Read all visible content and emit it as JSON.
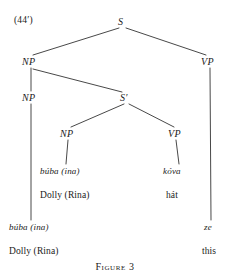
{
  "figure": {
    "example_number": "(44′)",
    "caption": "Figure 3",
    "width": 230,
    "height": 278,
    "line_color": "#333333",
    "text_color": "#1a1a1a",
    "background": "#ffffff"
  },
  "tree": {
    "type": "syntax-tree",
    "nodes": [
      {
        "id": "s-root",
        "label": "S",
        "x": 122,
        "y": 22,
        "kind": "nonterminal"
      },
      {
        "id": "np-outer",
        "label": "NP",
        "x": 29,
        "y": 62,
        "kind": "nonterminal"
      },
      {
        "id": "vp-outer",
        "label": "VP",
        "x": 208,
        "y": 62,
        "kind": "nonterminal"
      },
      {
        "id": "np-inner",
        "label": "NP",
        "x": 29,
        "y": 98,
        "kind": "nonterminal"
      },
      {
        "id": "sbar",
        "label": "S′",
        "x": 126,
        "y": 98,
        "kind": "nonterminal"
      },
      {
        "id": "np-embedded",
        "label": "NP",
        "x": 67,
        "y": 134,
        "kind": "nonterminal"
      },
      {
        "id": "vp-embedded",
        "label": "VP",
        "x": 175,
        "y": 134,
        "kind": "nonterminal"
      }
    ],
    "terminals": [
      {
        "id": "t-buba-inner",
        "word": "búba (ina)",
        "gloss": "Dolly (Rina)",
        "x": 62,
        "word_y": 171,
        "gloss_y": 196
      },
      {
        "id": "t-kova",
        "word": "kóva",
        "gloss": "hát",
        "x": 176,
        "word_y": 171,
        "gloss_y": 196
      },
      {
        "id": "t-buba-outer",
        "word": "búba (ina)",
        "gloss": "Dolly (Rina)",
        "x": 31,
        "word_y": 227,
        "gloss_y": 252
      },
      {
        "id": "t-ze",
        "word": "ze",
        "gloss": "this",
        "x": 211,
        "word_y": 227,
        "gloss_y": 252
      }
    ],
    "edges": [
      {
        "from": "s-root",
        "to": "np-outer"
      },
      {
        "from": "s-root",
        "to": "vp-outer"
      },
      {
        "from": "np-outer",
        "to": "np-inner"
      },
      {
        "from": "np-outer",
        "to": "sbar"
      },
      {
        "from": "sbar",
        "to": "np-embedded"
      },
      {
        "from": "sbar",
        "to": "vp-embedded"
      },
      {
        "from": "np-embedded",
        "to": "t-buba-inner"
      },
      {
        "from": "vp-embedded",
        "to": "t-kova"
      },
      {
        "from": "np-inner",
        "to": "t-buba-outer"
      },
      {
        "from": "vp-outer",
        "to": "t-ze"
      }
    ]
  }
}
